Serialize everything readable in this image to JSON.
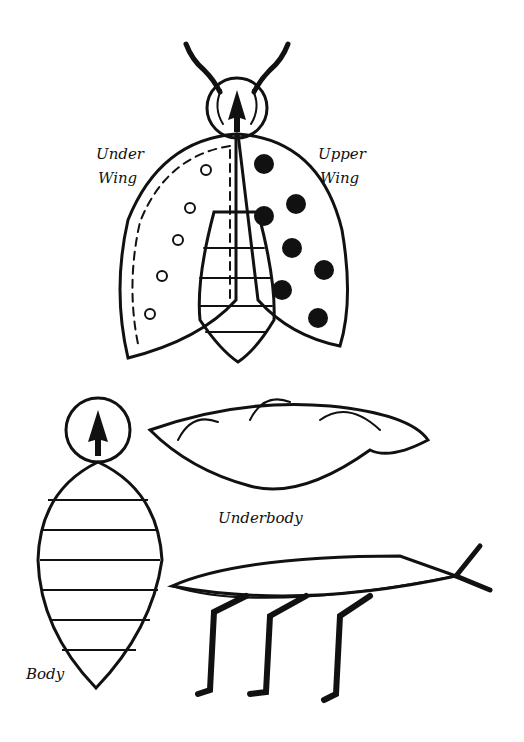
{
  "labels": {
    "under_wing_1": "Under",
    "under_wing_2": "Wing",
    "upper_wing_1": "Upper",
    "upper_wing_2": "Wing",
    "underbody": "Underbody",
    "body": "Body"
  },
  "colors": {
    "ink": "#111111",
    "paper": "#ffffff"
  }
}
